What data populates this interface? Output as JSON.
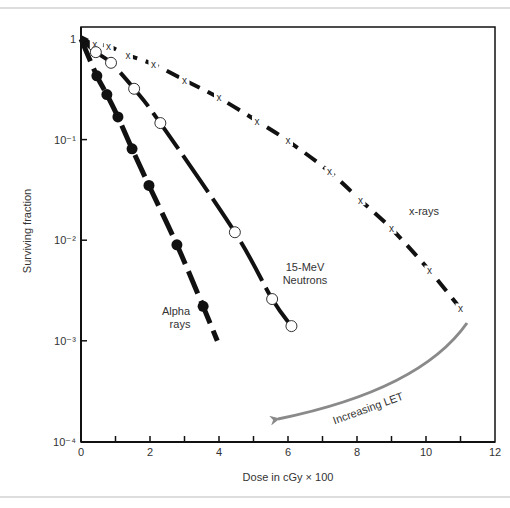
{
  "chart_data": {
    "type": "line",
    "title": "",
    "xlabel": "Dose in cGy × 100",
    "ylabel": "Surviving fraction",
    "xlim": [
      0,
      12
    ],
    "ylim": [
      0.0001,
      1
    ],
    "yscale": "log",
    "grid": false,
    "legend": "none (inline labels)",
    "x_ticks": [
      0,
      2,
      4,
      6,
      8,
      10,
      12
    ],
    "x_minor_ticks": [
      1,
      3,
      5,
      7,
      9,
      11
    ],
    "y_ticks": [
      {
        "value": 1,
        "label": "1"
      },
      {
        "value": 0.1,
        "label": "10⁻¹"
      },
      {
        "value": 0.01,
        "label": "10⁻²"
      },
      {
        "value": 0.001,
        "label": "10⁻³"
      },
      {
        "value": 0.0001,
        "label": "10⁻⁴"
      }
    ],
    "series": [
      {
        "name": "x-rays",
        "marker": "x",
        "line": "dashed",
        "x": [
          0,
          0.4,
          0.8,
          1.36,
          2.1,
          3.0,
          4.0,
          5.1,
          6.0,
          7.2,
          8.1,
          9.0,
          10.1,
          11.0
        ],
        "y": [
          1,
          0.89,
          0.85,
          0.69,
          0.56,
          0.39,
          0.26,
          0.153,
          0.097,
          0.048,
          0.025,
          0.013,
          0.005,
          0.0021
        ]
      },
      {
        "name": "15-MeV Neutrons",
        "marker": "open-circle",
        "line": "long-dash",
        "x": [
          0,
          0.43,
          0.87,
          1.54,
          2.3,
          4.46,
          5.54,
          6.1
        ],
        "y": [
          1,
          0.74,
          0.58,
          0.32,
          0.146,
          0.012,
          0.0026,
          0.0014
        ]
      },
      {
        "name": "Alpha rays",
        "marker": "filled-circle",
        "line": "dash-dot",
        "x": [
          0,
          0.46,
          0.75,
          1.07,
          1.48,
          1.97,
          2.78,
          3.54,
          3.95
        ],
        "y": [
          1,
          0.43,
          0.28,
          0.168,
          0.081,
          0.035,
          0.009,
          0.0022,
          0.001
        ]
      }
    ],
    "annotations": [
      {
        "text": "x-rays",
        "near_series": "x-rays"
      },
      {
        "text": "15-MeV Neutrons",
        "near_series": "15-MeV Neutrons"
      },
      {
        "text": "Alpha rays",
        "near_series": "Alpha rays"
      },
      {
        "text": "Increasing LET",
        "type": "curved-arrow",
        "from": "x-rays end",
        "to": "toward low dose",
        "color": "#888888"
      }
    ]
  },
  "labels": {
    "ylabel": "Surviving fraction",
    "xlabel": "Dose in cGy × 100",
    "xray": "x-rays",
    "neutron_1": "15-MeV",
    "neutron_2": "Neutrons",
    "alpha_1": "Alpha",
    "alpha_2": "rays",
    "arrow": "Increasing LET"
  },
  "colors": {
    "ink": "#111111",
    "text": "#333333",
    "arrow": "#8a8a8a",
    "rule": "#bbbbbb"
  }
}
